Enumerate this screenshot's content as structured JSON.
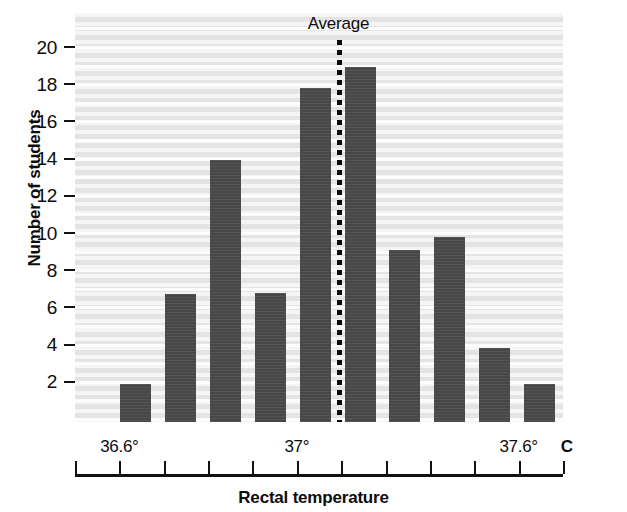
{
  "chart_data": {
    "type": "bar",
    "title": "",
    "xlabel": "Rectal temperature",
    "ylabel": "Number of students",
    "categories": [
      "36.5",
      "36.6",
      "36.7",
      "36.8",
      "36.9",
      "37.0",
      "37.1",
      "37.2",
      "37.3",
      "37.4"
    ],
    "values": [
      1.9,
      6.7,
      13.9,
      6.8,
      17.8,
      18.9,
      9.1,
      9.8,
      3.8,
      1.9
    ],
    "ylim": [
      0,
      21.5
    ],
    "yticks": [
      2,
      4,
      6,
      8,
      10,
      12,
      14,
      16,
      18,
      20
    ],
    "ytick_labels": [
      "2",
      "4",
      "6",
      "8",
      "10",
      "12",
      "14",
      "16",
      "18",
      "20"
    ],
    "xtick_count": 12,
    "xtick_labels": [
      {
        "index": 1,
        "text": "36.6°"
      },
      {
        "index": 5,
        "text": "37°"
      },
      {
        "index": 10,
        "text": "37.6°"
      }
    ],
    "x_unit_label": "C",
    "grid": "horizontal-banded",
    "legend": "none",
    "annotations": [
      {
        "name": "average-line",
        "label": "Average",
        "x_position_index": 5.0,
        "style": "dotted-vertical"
      }
    ],
    "bar_color": "#4b4b4b",
    "plot_background": "#e4e4e4"
  },
  "axis": {
    "y_title": "Number of students",
    "x_title": "Rectal temperature"
  },
  "annotation": {
    "average_label": "Average"
  }
}
